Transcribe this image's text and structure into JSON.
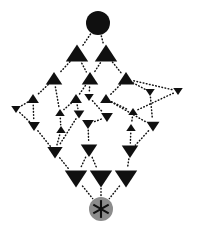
{
  "figure": {
    "title": "",
    "width": 198,
    "height": 232,
    "background": "#ffffff",
    "edge_color": "#101010",
    "edge_style": "dotted",
    "node_fill": "#101010"
  },
  "chart_data": {
    "type": "diagram",
    "subtype": "hasse-lattice",
    "title": "",
    "xlabel": "",
    "ylabel": "",
    "grid": false,
    "legend": null,
    "xlim": [
      0,
      198
    ],
    "ylim": [
      0,
      232
    ],
    "node_glyphs": {
      "top": "filled-circle",
      "bottom": "asterisk-in-gray-circle",
      "upper_half": "up-triangle",
      "lower_half": "down-triangle"
    },
    "colors": {
      "black": "#101010",
      "gray": "#8c8c8c",
      "white": "#ffffff"
    },
    "nodes": [
      {
        "id": "top",
        "x": 98,
        "y": 23,
        "shape": "circle",
        "size": 12.0,
        "fill": "#101010",
        "rank": 0
      },
      {
        "id": "u1a",
        "x": 77,
        "y": 54,
        "shape": "triangle-up",
        "size": 9.5,
        "fill": "#101010",
        "rank": 1
      },
      {
        "id": "u1b",
        "x": 106,
        "y": 54,
        "shape": "triangle-up",
        "size": 9.5,
        "fill": "#101010",
        "rank": 1
      },
      {
        "id": "u2a",
        "x": 54,
        "y": 79,
        "shape": "triangle-up",
        "size": 7.0,
        "fill": "#101010",
        "rank": 2
      },
      {
        "id": "u2b",
        "x": 90,
        "y": 79,
        "shape": "triangle-up",
        "size": 7.0,
        "fill": "#101010",
        "rank": 2
      },
      {
        "id": "u2c",
        "x": 126,
        "y": 79,
        "shape": "triangle-up",
        "size": 7.0,
        "fill": "#101010",
        "rank": 2
      },
      {
        "id": "u3a",
        "x": 33,
        "y": 99,
        "shape": "triangle-up",
        "size": 5.0,
        "fill": "#101010",
        "rank": 3
      },
      {
        "id": "u3b",
        "x": 76,
        "y": 99,
        "shape": "triangle-up",
        "size": 5.0,
        "fill": "#101010",
        "rank": 3
      },
      {
        "id": "u3c",
        "x": 106,
        "y": 99,
        "shape": "triangle-up",
        "size": 5.0,
        "fill": "#101010",
        "rank": 3
      },
      {
        "id": "d3a",
        "x": 89,
        "y": 97,
        "shape": "triangle-down",
        "size": 4.0,
        "fill": "#101010",
        "rank": 3
      },
      {
        "id": "d3b",
        "x": 150,
        "y": 92,
        "shape": "triangle-down",
        "size": 4.0,
        "fill": "#101010",
        "rank": 3
      },
      {
        "id": "d3c",
        "x": 178,
        "y": 91,
        "shape": "triangle-down",
        "size": 4.0,
        "fill": "#101010",
        "rank": 3
      },
      {
        "id": "d4a",
        "x": 16,
        "y": 109,
        "shape": "triangle-down",
        "size": 4.0,
        "fill": "#101010",
        "rank": 4
      },
      {
        "id": "u4a",
        "x": 60,
        "y": 113,
        "shape": "triangle-up",
        "size": 4.0,
        "fill": "#101010",
        "rank": 4
      },
      {
        "id": "d4b",
        "x": 79,
        "y": 114,
        "shape": "triangle-down",
        "size": 4.5,
        "fill": "#101010",
        "rank": 4
      },
      {
        "id": "d4c",
        "x": 107,
        "y": 117,
        "shape": "triangle-down",
        "size": 5.0,
        "fill": "#101010",
        "rank": 4
      },
      {
        "id": "u4b",
        "x": 133,
        "y": 112,
        "shape": "triangle-up",
        "size": 4.0,
        "fill": "#101010",
        "rank": 4
      },
      {
        "id": "d5a",
        "x": 34,
        "y": 126,
        "shape": "triangle-down",
        "size": 5.0,
        "fill": "#101010",
        "rank": 5
      },
      {
        "id": "u5a",
        "x": 61,
        "y": 130,
        "shape": "triangle-up",
        "size": 4.0,
        "fill": "#101010",
        "rank": 5
      },
      {
        "id": "d5b",
        "x": 88,
        "y": 124,
        "shape": "triangle-down",
        "size": 5.0,
        "fill": "#101010",
        "rank": 5
      },
      {
        "id": "u5b",
        "x": 131,
        "y": 128,
        "shape": "triangle-up",
        "size": 4.0,
        "fill": "#101010",
        "rank": 5
      },
      {
        "id": "d5c",
        "x": 153,
        "y": 126,
        "shape": "triangle-down",
        "size": 5.5,
        "fill": "#101010",
        "rank": 5
      },
      {
        "id": "d6a",
        "x": 55,
        "y": 152,
        "shape": "triangle-down",
        "size": 6.5,
        "fill": "#101010",
        "rank": 6
      },
      {
        "id": "d6b",
        "x": 89,
        "y": 150,
        "shape": "triangle-down",
        "size": 7.0,
        "fill": "#101010",
        "rank": 6
      },
      {
        "id": "d6c",
        "x": 130,
        "y": 151,
        "shape": "triangle-down",
        "size": 7.0,
        "fill": "#101010",
        "rank": 6
      },
      {
        "id": "d7a",
        "x": 76,
        "y": 178,
        "shape": "triangle-down",
        "size": 9.5,
        "fill": "#101010",
        "rank": 7
      },
      {
        "id": "d7b",
        "x": 101,
        "y": 178,
        "shape": "triangle-down",
        "size": 9.5,
        "fill": "#101010",
        "rank": 7
      },
      {
        "id": "d7c",
        "x": 126,
        "y": 178,
        "shape": "triangle-down",
        "size": 9.5,
        "fill": "#101010",
        "rank": 7
      },
      {
        "id": "bottom",
        "x": 101,
        "y": 209,
        "shape": "asterisk-circle",
        "size": 12.0,
        "fill": "#8c8c8c",
        "rank": 8
      }
    ],
    "edges": [
      {
        "from": "top",
        "to": "u1a"
      },
      {
        "from": "top",
        "to": "u1b"
      },
      {
        "from": "u1a",
        "to": "u2a"
      },
      {
        "from": "u1a",
        "to": "u2b"
      },
      {
        "from": "u1b",
        "to": "u2b"
      },
      {
        "from": "u1b",
        "to": "u2c"
      },
      {
        "from": "u2a",
        "to": "u3a"
      },
      {
        "from": "u2a",
        "to": "u4a"
      },
      {
        "from": "u2b",
        "to": "u3b"
      },
      {
        "from": "u2b",
        "to": "d3a"
      },
      {
        "from": "u2c",
        "to": "u3c"
      },
      {
        "from": "u2c",
        "to": "d3b"
      },
      {
        "from": "u2c",
        "to": "d3c"
      },
      {
        "from": "u3a",
        "to": "d5a"
      },
      {
        "from": "u3a",
        "to": "d4a"
      },
      {
        "from": "u3b",
        "to": "d4b"
      },
      {
        "from": "u3b",
        "to": "u4a"
      },
      {
        "from": "u3c",
        "to": "u4b"
      },
      {
        "from": "u3c",
        "to": "d5c"
      },
      {
        "from": "d3a",
        "to": "d4c"
      },
      {
        "from": "d3b",
        "to": "d5c"
      },
      {
        "from": "d3c",
        "to": "u4b"
      },
      {
        "from": "d4a",
        "to": "d5a"
      },
      {
        "from": "u4a",
        "to": "u5a"
      },
      {
        "from": "d4b",
        "to": "d6a"
      },
      {
        "from": "d4c",
        "to": "d5b"
      },
      {
        "from": "u4b",
        "to": "u5b"
      },
      {
        "from": "d5a",
        "to": "d6a"
      },
      {
        "from": "u5a",
        "to": "d6a"
      },
      {
        "from": "d5b",
        "to": "d6b"
      },
      {
        "from": "u5b",
        "to": "d6c"
      },
      {
        "from": "d5c",
        "to": "d6c"
      },
      {
        "from": "d6a",
        "to": "d7a"
      },
      {
        "from": "d6b",
        "to": "d7a"
      },
      {
        "from": "d6b",
        "to": "d7b"
      },
      {
        "from": "d6c",
        "to": "d7c"
      },
      {
        "from": "d7a",
        "to": "bottom"
      },
      {
        "from": "d7b",
        "to": "bottom"
      },
      {
        "from": "d7c",
        "to": "bottom"
      }
    ]
  }
}
